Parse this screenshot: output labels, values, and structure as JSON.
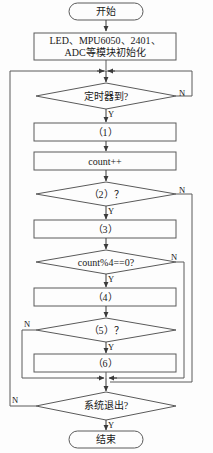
{
  "figure": {
    "type": "flowchart",
    "language": "zh-CN",
    "orientation": "vertical",
    "stroke_color": "#555555",
    "text_color": "#1a1a1a",
    "background_color": "#fdfdfd"
  },
  "nodes": {
    "start": {
      "shape": "terminator",
      "label": "开始"
    },
    "init": {
      "shape": "process",
      "label_line1": "LED、MPU6050、2401、",
      "label_line2": "ADC等模块初始化"
    },
    "timer_check": {
      "shape": "decision",
      "label": "定时器到?"
    },
    "step1": {
      "shape": "process",
      "label": "（1）"
    },
    "count_inc": {
      "shape": "process",
      "label": "count++"
    },
    "cond2": {
      "shape": "decision",
      "label": "（2）？"
    },
    "step3": {
      "shape": "process",
      "label": "（3）"
    },
    "count_mod": {
      "shape": "decision",
      "label": "count%4==0?"
    },
    "step4": {
      "shape": "process",
      "label": "（4）"
    },
    "cond5": {
      "shape": "decision",
      "label": "（5）？"
    },
    "step6": {
      "shape": "process",
      "label": "（6）"
    },
    "exit_check": {
      "shape": "decision",
      "label": "系统退出?"
    },
    "end": {
      "shape": "terminator",
      "label": "结束"
    }
  },
  "branch_labels": {
    "timer_no": "N",
    "timer_yes": "Y",
    "cond2_no": "N",
    "cond2_yes": "Y",
    "mod_no": "N",
    "mod_yes": "Y",
    "cond5_no": "N",
    "cond5_yes": "Y",
    "exit_no": "N",
    "exit_yes": "Y"
  },
  "edges": [
    {
      "from": "start",
      "to": "init",
      "label": ""
    },
    {
      "from": "init",
      "to": "timer_check",
      "label": ""
    },
    {
      "from": "timer_check",
      "to": "step1",
      "label": "Y"
    },
    {
      "from": "timer_check",
      "to": "exit_check",
      "label": "N"
    },
    {
      "from": "step1",
      "to": "count_inc",
      "label": ""
    },
    {
      "from": "count_inc",
      "to": "cond2",
      "label": ""
    },
    {
      "from": "cond2",
      "to": "step3",
      "label": "Y"
    },
    {
      "from": "cond2",
      "to": "exit_check",
      "label": "N"
    },
    {
      "from": "step3",
      "to": "count_mod",
      "label": ""
    },
    {
      "from": "count_mod",
      "to": "step4",
      "label": "Y"
    },
    {
      "from": "count_mod",
      "to": "exit_check",
      "label": "N"
    },
    {
      "from": "step4",
      "to": "cond5",
      "label": ""
    },
    {
      "from": "cond5",
      "to": "step6",
      "label": "Y"
    },
    {
      "from": "cond5",
      "to": "exit_check",
      "label": "N"
    },
    {
      "from": "step6",
      "to": "exit_check",
      "label": ""
    },
    {
      "from": "exit_check",
      "to": "end",
      "label": "Y"
    },
    {
      "from": "exit_check",
      "to": "timer_check",
      "label": "N"
    }
  ]
}
